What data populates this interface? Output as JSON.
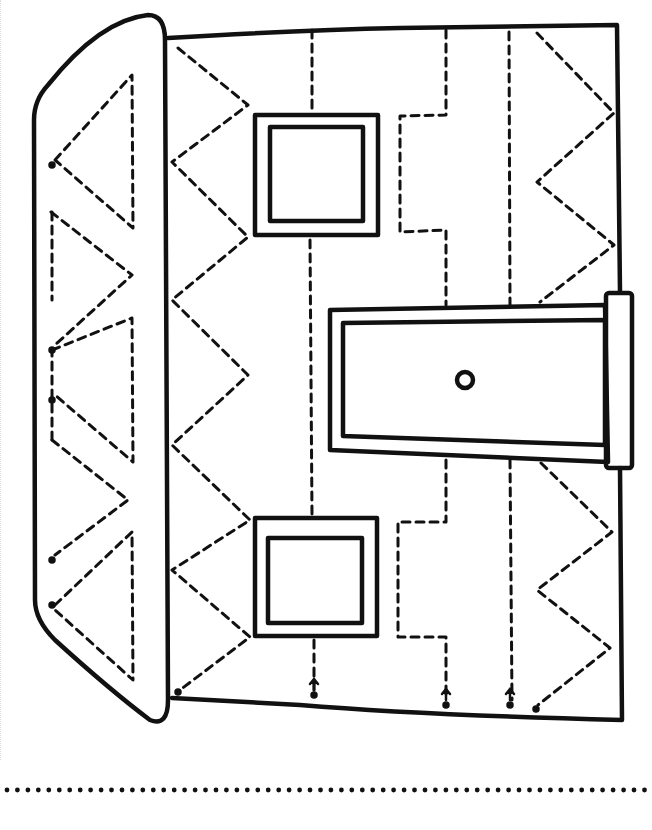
{
  "worksheet": {
    "type": "tracing worksheet",
    "subject": "house (rotated sideways)",
    "colors": {
      "ink": "#111111",
      "paper": "#ffffff"
    },
    "elements": {
      "roof": "solid outline with dashed triangle pattern",
      "wall": "solid outline",
      "windows": 2,
      "door": "door with round knob",
      "tracing_paths": [
        "zigzag",
        "vertical dashed",
        "step line",
        "vertical dashed",
        "zigzag"
      ],
      "start_markers": 8,
      "writing_line": "dotted baseline"
    }
  }
}
